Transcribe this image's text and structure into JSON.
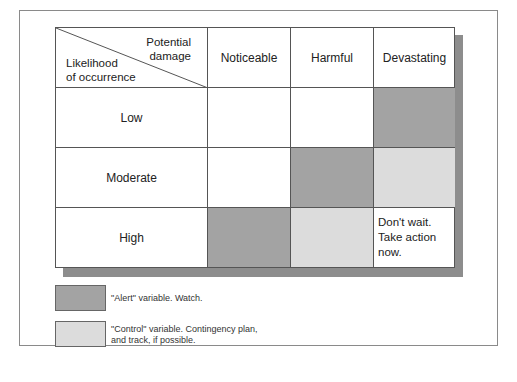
{
  "matrix": {
    "corner": {
      "top_label": [
        "Potential",
        "damage"
      ],
      "bottom_label": [
        "Likelihood",
        "of occurrence"
      ]
    },
    "columns": [
      "Noticeable",
      "Harmful",
      "Devastating"
    ],
    "rows": [
      {
        "label": "Low",
        "cells": [
          "none",
          "none",
          "alert"
        ]
      },
      {
        "label": "Moderate",
        "cells": [
          "none",
          "alert",
          "control"
        ]
      },
      {
        "label": "High",
        "cells": [
          "alert",
          "control",
          "note"
        ]
      }
    ],
    "note": [
      "Don't wait.",
      "Take action now."
    ]
  },
  "legend": [
    {
      "type": "alert",
      "color": "#a3a3a3",
      "text": [
        "\"Alert\" variable.  Watch."
      ]
    },
    {
      "type": "control",
      "color": "#dcdcdc",
      "text": [
        "\"Control\" variable.  Contingency plan,",
        "and track, if possible."
      ]
    }
  ]
}
